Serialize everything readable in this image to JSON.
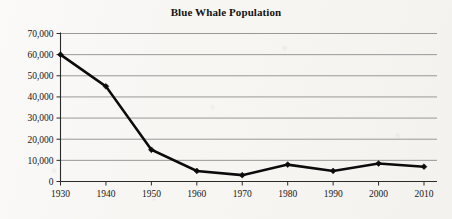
{
  "chart_data": {
    "type": "line",
    "title": "Blue Whale Population",
    "xlabel": "",
    "ylabel": "",
    "x": [
      1930,
      1940,
      1950,
      1960,
      1970,
      1980,
      1990,
      2000,
      2010
    ],
    "categories": [
      "1930",
      "1940",
      "1950",
      "1960",
      "1970",
      "1980",
      "1990",
      "2000",
      "2010"
    ],
    "values": [
      60000,
      45000,
      15000,
      5000,
      3000,
      8000,
      5000,
      8500,
      7000
    ],
    "series": [
      {
        "name": "Blue Whale Population",
        "values": [
          60000,
          45000,
          15000,
          5000,
          3000,
          8000,
          5000,
          8500,
          7000
        ]
      }
    ],
    "xlim": [
      1930,
      2010
    ],
    "ylim": [
      0,
      70000
    ],
    "ytick_values": [
      0,
      10000,
      20000,
      30000,
      40000,
      50000,
      60000,
      70000
    ],
    "ytick_labels": [
      "0",
      "10,000",
      "20,000",
      "30,000",
      "40,000",
      "50,000",
      "60,000",
      "70,000"
    ],
    "xtick_labels": [
      "1930",
      "1940",
      "1950",
      "1960",
      "1970",
      "1980",
      "1990",
      "2000",
      "2010"
    ],
    "grid": "horizontal",
    "legend": "none",
    "marker": "diamond",
    "line_color": "#0b0b0b",
    "grid_color": "#8d8d8d",
    "background_color": "#f7f6f3"
  }
}
